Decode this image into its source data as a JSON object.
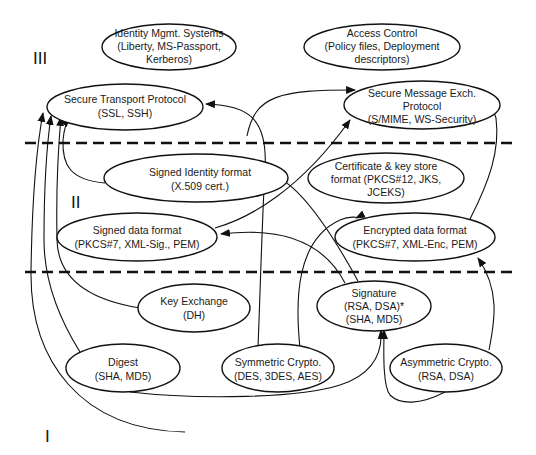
{
  "diagram": {
    "colors": {
      "stroke": "#111111",
      "background": "#ffffff",
      "text": "#1a1a1a"
    },
    "layers": [
      {
        "id": "III",
        "label": "III"
      },
      {
        "id": "II",
        "label": "II"
      },
      {
        "id": "I",
        "label": "I"
      }
    ],
    "nodes": {
      "identity_mgmt": {
        "lines": [
          "Identity Mgmt. Systems",
          "(Liberty, MS-Passport,",
          "Kerberos)"
        ]
      },
      "access_control": {
        "lines": [
          "Access Control",
          "(Policy files, Deployment",
          "descriptors)"
        ]
      },
      "secure_transport": {
        "lines": [
          "Secure Transport Protocol",
          "(SSL, SSH)"
        ]
      },
      "secure_message": {
        "lines": [
          "Secure Message Exch.",
          "Protocol",
          "(S/MIME, WS-Security)"
        ]
      },
      "signed_identity": {
        "lines": [
          "Signed Identity format",
          "(X.509 cert.)"
        ]
      },
      "cert_keystore": {
        "lines": [
          "Certificate & key store",
          "format (PKCS#12, JKS,",
          "JCEKS)"
        ]
      },
      "signed_data": {
        "lines": [
          "Signed data format",
          "(PKCS#7, XML-Sig., PEM)"
        ]
      },
      "encrypted_data": {
        "lines": [
          "Encrypted data format",
          "(PKCS#7, XML-Enc, PEM)"
        ]
      },
      "key_exchange": {
        "lines": [
          "Key Exchange",
          "(DH)"
        ]
      },
      "signature": {
        "lines": [
          "Signature",
          "(RSA, DSA)*",
          "(SHA, MD5)"
        ]
      },
      "digest": {
        "lines": [
          "Digest",
          "(SHA, MD5)"
        ]
      },
      "symmetric": {
        "lines": [
          "Symmetric Crypto.",
          "(DES, 3DES, AES)"
        ]
      },
      "asymmetric": {
        "lines": [
          "Asymmetric Crypto.",
          "(RSA, DSA)"
        ]
      }
    },
    "edges": [
      {
        "from": "digest",
        "to": "secure_transport"
      },
      {
        "from": "asymmetric",
        "to": "secure_transport"
      },
      {
        "from": "key_exchange",
        "to": "secure_transport"
      },
      {
        "from": "signed_identity",
        "to": "secure_transport"
      },
      {
        "from": "symmetric",
        "to": "secure_transport"
      },
      {
        "from": "signed_identity",
        "to": "secure_message"
      },
      {
        "from": "signed_data",
        "to": "secure_message"
      },
      {
        "from": "encrypted_data",
        "to": "secure_message"
      },
      {
        "from": "signature",
        "to": "signed_identity"
      },
      {
        "from": "signature",
        "to": "signed_data"
      },
      {
        "from": "symmetric",
        "to": "encrypted_data"
      },
      {
        "from": "asymmetric",
        "to": "encrypted_data"
      },
      {
        "from": "digest",
        "to": "signature"
      },
      {
        "from": "asymmetric",
        "to": "signature"
      }
    ]
  }
}
